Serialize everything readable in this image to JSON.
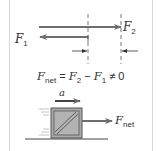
{
  "figure": {
    "top_panel": {
      "force1": {
        "symbol": "F",
        "subscript": "1",
        "direction": "left"
      },
      "force2": {
        "symbol": "F",
        "subscript": "2",
        "direction": "right"
      },
      "equation": {
        "lhs_symbol": "F",
        "lhs_subscript": "net",
        "equals": " = ",
        "term1_symbol": "F",
        "term1_subscript": "2",
        "minus": " − ",
        "term2_symbol": "F",
        "term2_subscript": "1",
        "relation": " ≠ 0"
      }
    },
    "bottom_panel": {
      "acceleration_label": "a",
      "net_force": {
        "symbol": "F",
        "subscript": "net"
      }
    },
    "colors": {
      "arrow": "#6e6e6e",
      "box_fill": "#a9a9a9",
      "box_outline": "#555555",
      "frame": "#d8d8d8",
      "speed_lines": "#b5b5b5",
      "ground": "#444444"
    }
  }
}
